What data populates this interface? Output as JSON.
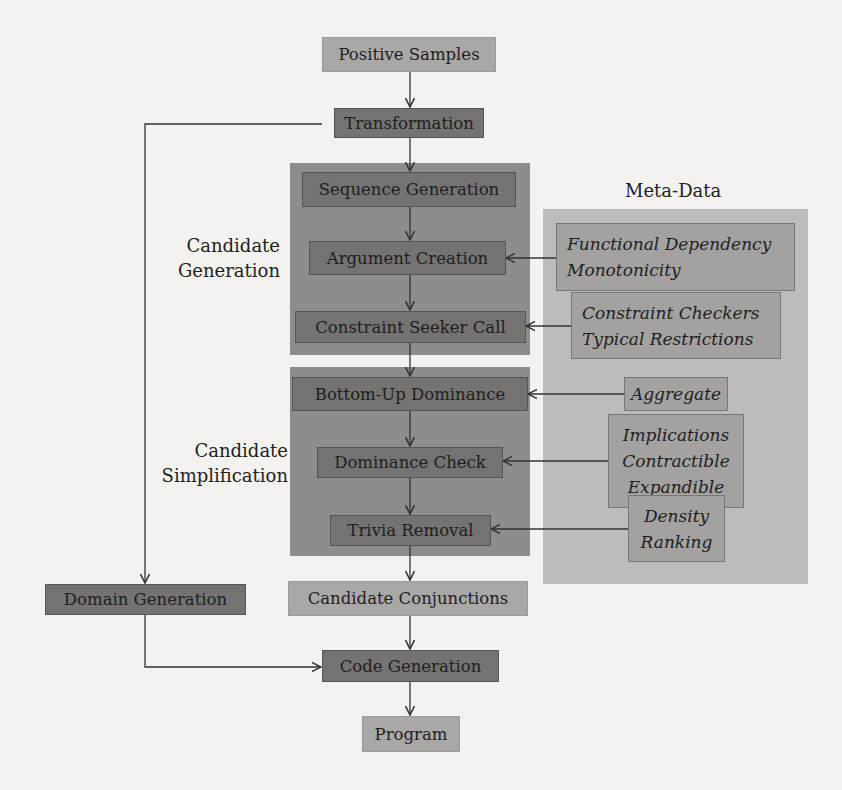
{
  "diagram": {
    "nodes": {
      "positive_samples": "Positive Samples",
      "transformation": "Transformation",
      "sequence_generation": "Sequence Generation",
      "argument_creation": "Argument Creation",
      "constraint_seeker_call": "Constraint Seeker Call",
      "bottom_up_dominance": "Bottom-Up Dominance",
      "dominance_check": "Dominance Check",
      "trivia_removal": "Trivia Removal",
      "candidate_conjunctions": "Candidate Conjunctions",
      "domain_generation": "Domain Generation",
      "code_generation": "Code Generation",
      "program": "Program"
    },
    "groups": {
      "candidate_generation": [
        "Candidate",
        "Generation"
      ],
      "candidate_simplification": [
        "Candidate",
        "Simplification"
      ]
    },
    "meta_data": {
      "title": "Meta-Data",
      "functional": [
        "Functional Dependency",
        "Monotonicity"
      ],
      "checkers": [
        "Constraint Checkers",
        "Typical Restrictions"
      ],
      "aggregate": [
        "Aggregate"
      ],
      "implications": [
        "Implications",
        "Contractible",
        "Expandible"
      ],
      "density": [
        "Density",
        "Ranking"
      ]
    }
  }
}
